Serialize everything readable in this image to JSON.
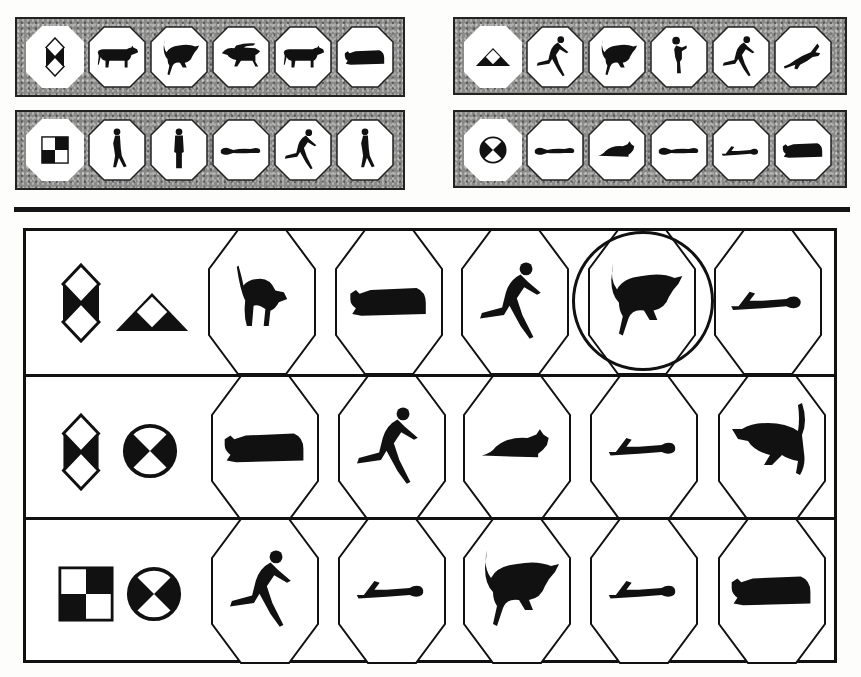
{
  "practice_panels": [
    {
      "id": "top-left-1",
      "cue": "diamond-split",
      "items": [
        "cow-standing",
        "bull-leaping",
        "bull-walking",
        "cow-standing",
        "cow-lying"
      ]
    },
    {
      "id": "top-left-2",
      "cue": "checker-square",
      "items": [
        "person-walking",
        "person-standing",
        "person-lying",
        "person-running",
        "person-walking"
      ]
    },
    {
      "id": "top-right-1",
      "cue": "triangle-split",
      "items": [
        "person-running",
        "bull-leaping",
        "person-throwing",
        "person-running",
        "cat-leaping"
      ]
    },
    {
      "id": "top-right-2",
      "cue": "circle-cross",
      "items": [
        "person-lying",
        "cat-crouching",
        "person-lying",
        "person-lying-knee",
        "cow-lying"
      ]
    }
  ],
  "test_rows": [
    {
      "cues": [
        "diamond-split",
        "triangle-split"
      ],
      "options": [
        "cat-arched",
        "cow-lying",
        "person-running",
        "bull-leaping",
        "person-lying-knee"
      ],
      "selected_index": 3
    },
    {
      "cues": [
        "diamond-split",
        "circle-cross"
      ],
      "options": [
        "cow-lying",
        "person-running",
        "cat-crouching",
        "person-lying-knee",
        "bull-leaping-left"
      ],
      "selected_index": null
    },
    {
      "cues": [
        "checker-square",
        "circle-cross"
      ],
      "options": [
        "person-running",
        "person-lying-knee",
        "bull-leaping",
        "person-lying-knee",
        "cow-lying"
      ],
      "selected_index": null
    }
  ],
  "colors": {
    "ink": "#111111",
    "paper": "#ffffff",
    "panel_gray": "#8a8a88"
  }
}
